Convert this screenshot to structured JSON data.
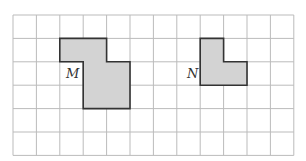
{
  "grid": {
    "cols": 12,
    "rows": 6,
    "x0": 13,
    "y0": 15,
    "cell": 23.4,
    "line_color": "#bbbbbb"
  },
  "shapes": [
    {
      "label": "M",
      "fill": "#d3d3d3",
      "stroke": "#333333",
      "cells": [
        [
          2,
          1
        ],
        [
          3,
          1
        ],
        [
          3,
          2
        ],
        [
          4,
          2
        ],
        [
          3,
          3
        ],
        [
          4,
          3
        ]
      ]
    },
    {
      "label": "N",
      "fill": "#d3d3d3",
      "stroke": "#333333",
      "cells": [
        [
          8,
          1
        ],
        [
          8,
          2
        ],
        [
          9,
          2
        ]
      ]
    }
  ],
  "labels": {
    "m": "M",
    "n": "N"
  }
}
